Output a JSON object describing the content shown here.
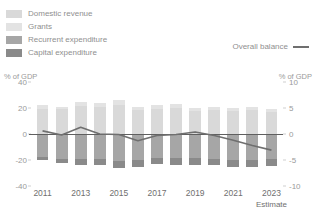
{
  "legend": {
    "items": [
      {
        "label": "Domestic revenue",
        "color": "#d9d9d9",
        "swatch": "legend-swatch-domestic-revenue"
      },
      {
        "label": "Grants",
        "color": "#e3e3e3",
        "swatch": "legend-swatch-grants"
      },
      {
        "label": "Recurrent expenditure",
        "color": "#a6a6a6",
        "swatch": "legend-swatch-recurrent-expenditure"
      },
      {
        "label": "Capital expenditure",
        "color": "#8a8a8a",
        "swatch": "legend-swatch-capital-expenditure"
      }
    ],
    "line_item": {
      "label": "Overall balance",
      "color": "#6f6f6f"
    }
  },
  "axes": {
    "left_title": "% of GDP",
    "right_title": "% of GDP",
    "left_ticks": [
      "40",
      "20",
      "0",
      "-20",
      "-40"
    ],
    "right_ticks": [
      "10",
      "5",
      "0",
      "-5",
      "-10"
    ],
    "x_ticks": [
      "2011",
      "2013",
      "2015",
      "2017",
      "2019",
      "2021",
      "2023"
    ],
    "x_note": "Estimate"
  },
  "chart_data": {
    "type": "bar",
    "title": "",
    "xlabel": "",
    "ylabel": "% of GDP",
    "y2label": "% of GDP",
    "ylim": [
      -40,
      40
    ],
    "y2lim": [
      -10,
      10
    ],
    "grid": false,
    "legend_position": "top-left",
    "stacked": true,
    "categories": [
      "2011",
      "2012",
      "2013",
      "2014",
      "2015",
      "2016",
      "2017",
      "2018",
      "2019",
      "2020",
      "2021",
      "2022",
      "2023"
    ],
    "series": [
      {
        "name": "Domestic revenue",
        "color": "#d9d9d9",
        "axis": "left",
        "values": [
          19.5,
          19.0,
          21.5,
          20.5,
          22.5,
          18.5,
          19.5,
          20.0,
          18.0,
          18.5,
          18.0,
          18.5,
          17.0
        ]
      },
      {
        "name": "Grants",
        "color": "#e3e3e3",
        "axis": "left",
        "values": [
          3.0,
          2.0,
          3.5,
          3.0,
          3.5,
          2.0,
          2.5,
          3.0,
          2.0,
          2.5,
          2.0,
          2.5,
          2.0
        ]
      },
      {
        "name": "Recurrent expenditure",
        "color": "#a6a6a6",
        "axis": "left",
        "values": [
          -17.5,
          -19.0,
          -19.5,
          -19.5,
          -20.5,
          -20.0,
          -18.5,
          -18.5,
          -18.5,
          -19.5,
          -20.0,
          -20.0,
          -19.5
        ]
      },
      {
        "name": "Capital expenditure",
        "color": "#8a8a8a",
        "axis": "left",
        "values": [
          -2.5,
          -3.5,
          -4.0,
          -4.0,
          -6.0,
          -5.5,
          -4.5,
          -5.5,
          -5.0,
          -4.5,
          -5.0,
          -5.0,
          -5.0
        ]
      }
    ],
    "line_series": {
      "name": "Overall balance",
      "color": "#6f6f6f",
      "axis": "right",
      "unit": "% of GDP",
      "values": [
        0.6,
        -0.2,
        1.3,
        0.0,
        -0.1,
        -1.3,
        -0.3,
        -0.1,
        0.4,
        -0.3,
        -1.2,
        -2.2,
        -3.1
      ]
    }
  }
}
